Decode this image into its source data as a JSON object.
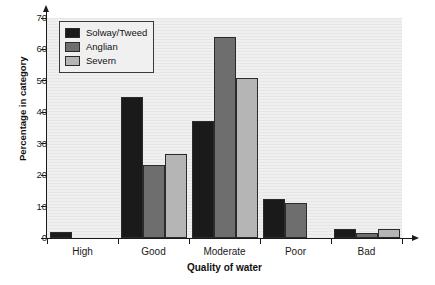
{
  "chart_data": {
    "type": "bar",
    "title": "",
    "xlabel": "Quality of water",
    "ylabel": "Percentage in category",
    "categories": [
      "High",
      "Good",
      "Moderate",
      "Poor",
      "Bad"
    ],
    "series": [
      {
        "name": "Solway/Tweed",
        "color": "#1a1a1a",
        "values": [
          2.0,
          45.0,
          37.3,
          12.5,
          2.8
        ]
      },
      {
        "name": "Anglian",
        "color": "#6e6e6e",
        "values": [
          0.0,
          23.2,
          64.0,
          11.2,
          1.6
        ]
      },
      {
        "name": "Severn",
        "color": "#b5b5b5",
        "values": [
          0.0,
          26.7,
          51.0,
          0.0,
          2.8
        ]
      }
    ],
    "ylim": [
      0,
      70
    ],
    "yticks": [
      0,
      10,
      20,
      30,
      40,
      50,
      60,
      70
    ],
    "ytick_labels": [
      "0",
      "10",
      "20",
      "30",
      "40",
      "50",
      "60",
      "70"
    ],
    "grid": false,
    "background_color": "#ebebeb",
    "axis_color": "#1a1a1a",
    "legend_position": "upper-left"
  }
}
